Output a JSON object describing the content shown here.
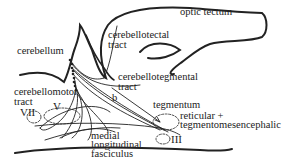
{
  "diagram": {
    "type": "neuroanatomy-pathway",
    "colors": {
      "background": "#ffffff",
      "ink": "#222222"
    },
    "labels": {
      "optic_tectum": "optic tectum",
      "cerebellum": "cerebellum",
      "cerebellotectal_1": "cerebellotectal",
      "cerebellotectal_2": "tract",
      "cerebellotegmental_1": "cerebellotegmental",
      "cerebellotegmental_2": "tract",
      "cerebellomotor_1": "cerebellomotor",
      "cerebellomotor_2": "tract",
      "nucleus_vii": "VII",
      "nucleus_v": "V",
      "nucleus_iii": "III",
      "branch_b": "b",
      "mlf_1": "medial",
      "mlf_2": "longitudinal",
      "mlf_3": "fasciculus",
      "tegmentum": "tegmentum",
      "reticular_1": "reticular +",
      "reticular_2": "tegmentomesencephalic"
    }
  }
}
